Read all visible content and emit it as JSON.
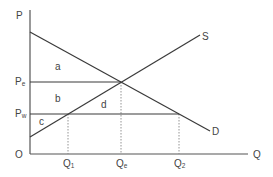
{
  "diagram": {
    "type": "supply-demand",
    "axes": {
      "y_label": "P",
      "x_label": "Q",
      "origin_label": "O"
    },
    "curves": {
      "demand_label": "D",
      "supply_label": "S"
    },
    "price_levels": [
      {
        "main": "P",
        "sub": "e",
        "meaning": "equilibrium price"
      },
      {
        "main": "P",
        "sub": "w",
        "meaning": "world price"
      }
    ],
    "quantity_levels": [
      {
        "main": "Q",
        "sub": "1"
      },
      {
        "main": "Q",
        "sub": "e"
      },
      {
        "main": "Q",
        "sub": "2"
      }
    ],
    "regions": [
      {
        "label": "a"
      },
      {
        "label": "b"
      },
      {
        "label": "c"
      },
      {
        "label": "d"
      }
    ],
    "colors": {
      "line": "#3a3a3a",
      "axis": "#555555",
      "guide": "#888888",
      "text": "#444444",
      "background": "#ffffff"
    }
  }
}
